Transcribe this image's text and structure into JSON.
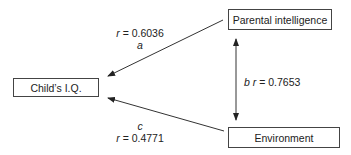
{
  "diagram": {
    "nodes": {
      "child_iq": {
        "label": "Child’s I.Q."
      },
      "parental_intelligence": {
        "label": "Parental intelligence"
      },
      "environment": {
        "label": "Environment"
      }
    },
    "edges": {
      "a": {
        "from": "Parental intelligence",
        "to": "Child’s I.Q.",
        "path": "a",
        "r_label": "r = 0.6036",
        "r_var": "r",
        "r_value": "= 0.6036"
      },
      "b": {
        "from": "Parental intelligence",
        "to": "Environment",
        "path": "b",
        "r_label": "r = 0.7653",
        "r_var": "r",
        "r_value": "= 0.7653",
        "bidirectional": true
      },
      "c": {
        "from": "Environment",
        "to": "Child’s I.Q.",
        "path": "c",
        "r_label": "r = 0.4771",
        "r_var": "r",
        "r_value": "= 0.4771"
      }
    },
    "colors": {
      "line": "#333333",
      "box_border": "#444444",
      "text": "#222222"
    }
  }
}
